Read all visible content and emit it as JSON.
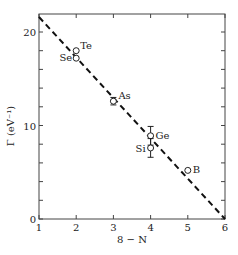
{
  "chart_data": {
    "type": "scatter",
    "title": "",
    "xlabel": "8 − N",
    "ylabel": "Γ (eV⁻¹)",
    "xlim": [
      1,
      6
    ],
    "ylim": [
      0,
      22
    ],
    "x_ticks": [
      1,
      2,
      3,
      4,
      5,
      6
    ],
    "x_tick_labels": [
      "1",
      "2",
      "3",
      "4",
      "5",
      "6"
    ],
    "y_ticks_major": [
      0,
      10,
      20
    ],
    "y_tick_labels": [
      "0",
      "10",
      "20"
    ],
    "y_ticks_minor": [
      2,
      4,
      6,
      8,
      12,
      14,
      16,
      18
    ],
    "grid": false,
    "legend": null,
    "series": [
      {
        "name": "Elements",
        "marker": "open-circle",
        "points": [
          {
            "label": "Te",
            "x": 2,
            "y": 18.0
          },
          {
            "label": "Se",
            "x": 2,
            "y": 17.2
          },
          {
            "label": "As",
            "x": 3,
            "y": 12.6,
            "error": 0.4
          },
          {
            "label": "Ge",
            "x": 4,
            "y": 8.9,
            "error": 1.0
          },
          {
            "label": "Si",
            "x": 4,
            "y": 7.6,
            "error": 1.0
          },
          {
            "label": "B",
            "x": 5,
            "y": 5.2
          }
        ]
      },
      {
        "name": "Linear fit",
        "style": "dashed",
        "x": [
          1,
          6
        ],
        "y": [
          21.6,
          0
        ]
      }
    ],
    "colors": {
      "ink": "#222222",
      "background": "#ffffff"
    }
  }
}
